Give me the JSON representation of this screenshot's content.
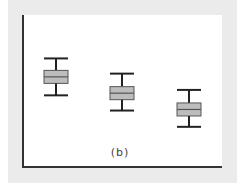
{
  "chart_data": {
    "type": "box",
    "title": "",
    "caption": "(b)",
    "xlabel": "",
    "ylabel": "",
    "categories": [
      "1",
      "2",
      "3"
    ],
    "boxes": [
      {
        "whisker_high": 10.0,
        "q3": 8.9,
        "median": 8.3,
        "q1": 7.7,
        "whisker_low": 6.6
      },
      {
        "whisker_high": 8.6,
        "q3": 7.4,
        "median": 6.8,
        "q1": 6.2,
        "whisker_low": 5.2
      },
      {
        "whisker_high": 7.1,
        "q3": 5.9,
        "median": 5.3,
        "q1": 4.7,
        "whisker_low": 3.7
      }
    ],
    "ylim": [
      0,
      14
    ],
    "grid": false,
    "box_fill": "#bdbdbd",
    "line_color": "#222222"
  },
  "caption": "(b)"
}
